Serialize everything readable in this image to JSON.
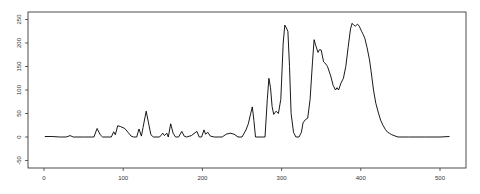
{
  "chart_data": {
    "type": "line",
    "title": "",
    "xlabel": "",
    "ylabel": "",
    "xlim": [
      -12,
      530
    ],
    "ylim": [
      -62,
      265
    ],
    "x_ticks": [
      0,
      100,
      200,
      300,
      400,
      500
    ],
    "y_ticks": [
      -50,
      0,
      50,
      100,
      150,
      200,
      250
    ],
    "grid": false,
    "legend": null,
    "series": [
      {
        "name": "signal",
        "color": "#000000",
        "points": [
          [
            1,
            1
          ],
          [
            10,
            1
          ],
          [
            20,
            0
          ],
          [
            28,
            0
          ],
          [
            33,
            3
          ],
          [
            37,
            0
          ],
          [
            50,
            0
          ],
          [
            60,
            0
          ],
          [
            63,
            0
          ],
          [
            67,
            18
          ],
          [
            71,
            5
          ],
          [
            74,
            0
          ],
          [
            82,
            0
          ],
          [
            85,
            0
          ],
          [
            88,
            11
          ],
          [
            90,
            5
          ],
          [
            93,
            24
          ],
          [
            97,
            22
          ],
          [
            102,
            18
          ],
          [
            106,
            10
          ],
          [
            110,
            2
          ],
          [
            113,
            0
          ],
          [
            117,
            0
          ],
          [
            120,
            17
          ],
          [
            123,
            2
          ],
          [
            125,
            20
          ],
          [
            129,
            55
          ],
          [
            132,
            30
          ],
          [
            135,
            5
          ],
          [
            138,
            0
          ],
          [
            146,
            0
          ],
          [
            148,
            4
          ],
          [
            150,
            8
          ],
          [
            152,
            3
          ],
          [
            155,
            8
          ],
          [
            157,
            0
          ],
          [
            160,
            28
          ],
          [
            163,
            8
          ],
          [
            166,
            0
          ],
          [
            170,
            0
          ],
          [
            174,
            12
          ],
          [
            177,
            2
          ],
          [
            180,
            0
          ],
          [
            186,
            3
          ],
          [
            193,
            12
          ],
          [
            196,
            0
          ],
          [
            199,
            0
          ],
          [
            202,
            15
          ],
          [
            204,
            6
          ],
          [
            207,
            10
          ],
          [
            210,
            2
          ],
          [
            215,
            0
          ],
          [
            225,
            0
          ],
          [
            230,
            6
          ],
          [
            235,
            8
          ],
          [
            240,
            6
          ],
          [
            245,
            0
          ],
          [
            250,
            0
          ],
          [
            255,
            15
          ],
          [
            258,
            28
          ],
          [
            261,
            50
          ],
          [
            263,
            64
          ],
          [
            265,
            35
          ],
          [
            267,
            0
          ],
          [
            276,
            0
          ],
          [
            279,
            0
          ],
          [
            282,
            80
          ],
          [
            284,
            125
          ],
          [
            286,
            105
          ],
          [
            288,
            65
          ],
          [
            290,
            48
          ],
          [
            293,
            55
          ],
          [
            296,
            50
          ],
          [
            299,
            80
          ],
          [
            302,
            200
          ],
          [
            304,
            238
          ],
          [
            306,
            232
          ],
          [
            308,
            225
          ],
          [
            310,
            150
          ],
          [
            312,
            50
          ],
          [
            315,
            10
          ],
          [
            318,
            0
          ],
          [
            322,
            0
          ],
          [
            325,
            10
          ],
          [
            327,
            30
          ],
          [
            330,
            37
          ],
          [
            333,
            40
          ],
          [
            336,
            80
          ],
          [
            339,
            160
          ],
          [
            341,
            207
          ],
          [
            343,
            195
          ],
          [
            346,
            180
          ],
          [
            348,
            186
          ],
          [
            350,
            185
          ],
          [
            352,
            168
          ],
          [
            353,
            160
          ],
          [
            356,
            155
          ],
          [
            358,
            150
          ],
          [
            362,
            130
          ],
          [
            365,
            110
          ],
          [
            368,
            100
          ],
          [
            370,
            105
          ],
          [
            372,
            100
          ],
          [
            375,
            115
          ],
          [
            378,
            125
          ],
          [
            381,
            150
          ],
          [
            384,
            190
          ],
          [
            387,
            230
          ],
          [
            389,
            242
          ],
          [
            391,
            238
          ],
          [
            393,
            236
          ],
          [
            396,
            240
          ],
          [
            398,
            236
          ],
          [
            401,
            225
          ],
          [
            403,
            218
          ],
          [
            405,
            210
          ],
          [
            408,
            190
          ],
          [
            411,
            164
          ],
          [
            413,
            140
          ],
          [
            416,
            100
          ],
          [
            419,
            72
          ],
          [
            422,
            53
          ],
          [
            425,
            36
          ],
          [
            428,
            25
          ],
          [
            431,
            16
          ],
          [
            434,
            10
          ],
          [
            436,
            8
          ],
          [
            439,
            5
          ],
          [
            442,
            3
          ],
          [
            447,
            0
          ],
          [
            460,
            0
          ],
          [
            480,
            0
          ],
          [
            500,
            0
          ],
          [
            512,
            1
          ]
        ]
      }
    ]
  },
  "axes": {
    "x_tick_labels": [
      "0",
      "100",
      "200",
      "300",
      "400",
      "500"
    ],
    "y_tick_labels": [
      "-50",
      "0",
      "50",
      "100",
      "150",
      "200",
      "250"
    ]
  }
}
